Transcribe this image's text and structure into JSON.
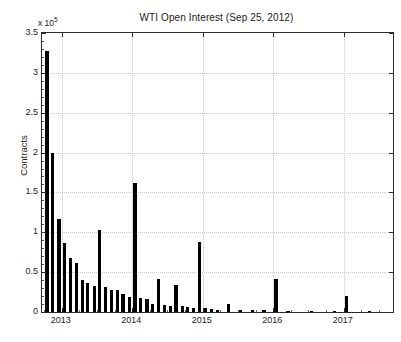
{
  "chart_data": {
    "type": "bar",
    "title": "WTI Open Interest (Sep 25, 2012)",
    "xlabel": "",
    "ylabel": "Contracts",
    "y_exponent_label": "x 10",
    "y_exponent_power": "5",
    "y_multiplier": 100000,
    "grid": true,
    "legend": null,
    "xlim": [
      2012.72,
      2017.7
    ],
    "ylim": [
      0,
      3.5
    ],
    "xtick_labels": [
      "2013",
      "2014",
      "2015",
      "2016",
      "2017"
    ],
    "xticks": [
      2013,
      2014,
      2015,
      2016,
      2017
    ],
    "ytick_labels": [
      "0",
      "0.5",
      "1",
      "1.5",
      "2",
      "2.5",
      "3",
      "3.5"
    ],
    "yticks": [
      0,
      0.5,
      1,
      1.5,
      2,
      2.5,
      3,
      3.5
    ],
    "x": [
      2012.79,
      2012.87,
      2012.96,
      2013.04,
      2013.12,
      2013.21,
      2013.29,
      2013.37,
      2013.46,
      2013.54,
      2013.62,
      2013.71,
      2013.79,
      2013.87,
      2013.96,
      2014.04,
      2014.12,
      2014.21,
      2014.29,
      2014.37,
      2014.46,
      2014.54,
      2014.62,
      2014.71,
      2014.79,
      2014.87,
      2014.96,
      2015.04,
      2015.12,
      2015.21,
      2015.37,
      2015.54,
      2015.71,
      2015.87,
      2016.04,
      2016.21,
      2016.54,
      2016.87,
      2017.04,
      2017.37
    ],
    "values": [
      3.28,
      2.0,
      1.17,
      0.86,
      0.68,
      0.62,
      0.4,
      0.36,
      0.33,
      1.03,
      0.31,
      0.28,
      0.27,
      0.23,
      0.19,
      1.62,
      0.18,
      0.16,
      0.1,
      0.42,
      0.09,
      0.07,
      0.34,
      0.07,
      0.06,
      0.05,
      0.88,
      0.05,
      0.04,
      0.03,
      0.1,
      0.02,
      0.02,
      0.02,
      0.42,
      0.01,
      0.01,
      0.01,
      0.2,
      0.01
    ],
    "bar_color": "#000000",
    "axis_color": "#2b2b2b",
    "grid_color": "#c8c8c8",
    "background": "#ffffff"
  }
}
